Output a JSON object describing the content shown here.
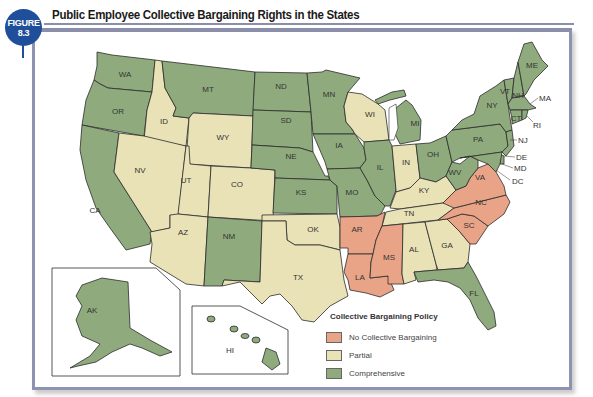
{
  "figure": {
    "badge_line1": "FIGURE",
    "badge_line2": "8.3",
    "title": "Public Employee Collective Bargaining Rights in the States"
  },
  "colors": {
    "none": "#e9a488",
    "partial": "#e9e2b6",
    "comprehensive": "#8fab7e",
    "badge": "#1f4f9b",
    "frame": "#8e93b0"
  },
  "legend": {
    "title": "Collective Bargaining Policy",
    "items": [
      {
        "key": "none",
        "label": "No Collective Bargaining"
      },
      {
        "key": "partial",
        "label": "Partial"
      },
      {
        "key": "comprehensive",
        "label": "Comprehensive"
      }
    ]
  },
  "states": {
    "comprehensive": [
      "WA",
      "OR",
      "CA",
      "MT",
      "ND",
      "SD",
      "NE",
      "KS",
      "MN",
      "IA",
      "MO",
      "IL",
      "MI",
      "OH",
      "PA",
      "NY",
      "WV",
      "NM",
      "FL",
      "AK",
      "HI",
      "ME",
      "VT",
      "NH",
      "MA",
      "CT",
      "RI",
      "NJ",
      "DE",
      "MD",
      "DC"
    ],
    "partial": [
      "ID",
      "NV",
      "UT",
      "WY",
      "CO",
      "AZ",
      "TX",
      "OK",
      "WI",
      "IN",
      "KY",
      "TN",
      "AL",
      "GA"
    ],
    "none": [
      "AR",
      "LA",
      "MS",
      "VA",
      "NC",
      "SC"
    ]
  },
  "labels": {
    "WA": "WA",
    "OR": "OR",
    "CA": "CA",
    "ID": "ID",
    "NV": "NV",
    "MT": "MT",
    "WY": "WY",
    "UT": "UT",
    "CO": "CO",
    "AZ": "AZ",
    "NM": "NM",
    "ND": "ND",
    "SD": "SD",
    "NE": "NE",
    "KS": "KS",
    "OK": "OK",
    "TX": "TX",
    "MN": "MN",
    "IA": "IA",
    "MO": "MO",
    "AR": "AR",
    "LA": "LA",
    "WI": "WI",
    "IL": "IL",
    "MI": "MI",
    "IN": "IN",
    "OH": "OH",
    "KY": "KY",
    "TN": "TN",
    "MS": "MS",
    "AL": "AL",
    "GA": "GA",
    "FL": "FL",
    "SC": "SC",
    "NC": "NC",
    "VA": "VA",
    "WV": "WV",
    "PA": "PA",
    "NY": "NY",
    "VT": "VT",
    "NH": "NH",
    "ME": "ME",
    "MA": "MA",
    "RI": "RI",
    "CT": "CT",
    "NJ": "NJ",
    "DE": "DE",
    "MD": "MD",
    "DC": "DC",
    "AK": "AK",
    "HI": "HI"
  }
}
